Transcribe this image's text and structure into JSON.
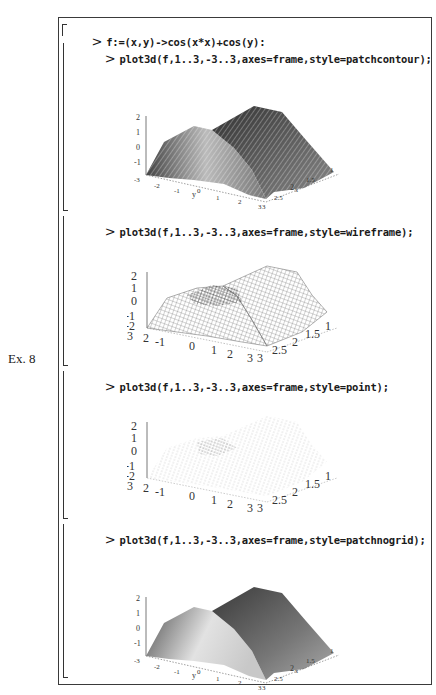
{
  "example_label": "Ex. 8",
  "worksheet": {
    "definition": {
      "prompt": ">",
      "code": "f:=(x,y)->cos(x*x)+cos(y):"
    },
    "commands": [
      {
        "prompt": ">",
        "code": "plot3d(f,1..3,-3..3,axes=frame,style=patchcontour);",
        "style": "patchcontour"
      },
      {
        "prompt": ">",
        "code": "plot3d(f,1..3,-3..3,axes=frame,style=wireframe);",
        "style": "wireframe"
      },
      {
        "prompt": ">",
        "code": "plot3d(f,1..3,-3..3,axes=frame,style=point);",
        "style": "point"
      },
      {
        "prompt": ">",
        "code": "plot3d(f,1..3,-3..3,axes=frame,style=patchnogrid);",
        "style": "patchnogrid"
      }
    ]
  },
  "plots": [
    {
      "z_ticks": [
        "2",
        "1",
        "0",
        "-1"
      ],
      "y_ticks": [
        "-3",
        "-2",
        "-1",
        "0",
        "1",
        "2",
        "3"
      ],
      "y_label": "y",
      "x_ticks": [
        "3",
        "2.5",
        "2",
        "1.5",
        "1"
      ],
      "x_label": "x"
    },
    {
      "z_ticks": [
        "2",
        "1",
        "0",
        "-1",
        "-2"
      ],
      "y_ticks": [
        "-3",
        "2",
        "-1",
        "0",
        "1",
        "2",
        "3"
      ],
      "x_ticks": [
        "3",
        "2.5",
        "2",
        "1.5",
        "1"
      ]
    },
    {
      "z_ticks": [
        "2",
        "1",
        "0",
        "-1",
        "-2"
      ],
      "y_ticks": [
        "-3",
        "2",
        "-1",
        "0",
        "1",
        "2",
        "3"
      ],
      "x_ticks": [
        "3",
        "2.5",
        "2",
        "1.5",
        "1"
      ]
    },
    {
      "z_ticks": [
        "2",
        "1",
        "0",
        "-1"
      ],
      "y_ticks": [
        "-3",
        "-2",
        "-1",
        "0",
        "1",
        "2",
        "3"
      ],
      "y_label": "y",
      "x_ticks": [
        "3",
        "2.5",
        "2",
        "1.5",
        "1"
      ],
      "x_label": "x"
    }
  ],
  "colors": {
    "ink": "#1a1a1a",
    "frame": "#3a3a3a",
    "surface_dark": "#555555",
    "surface_light": "#d8d8d8"
  }
}
